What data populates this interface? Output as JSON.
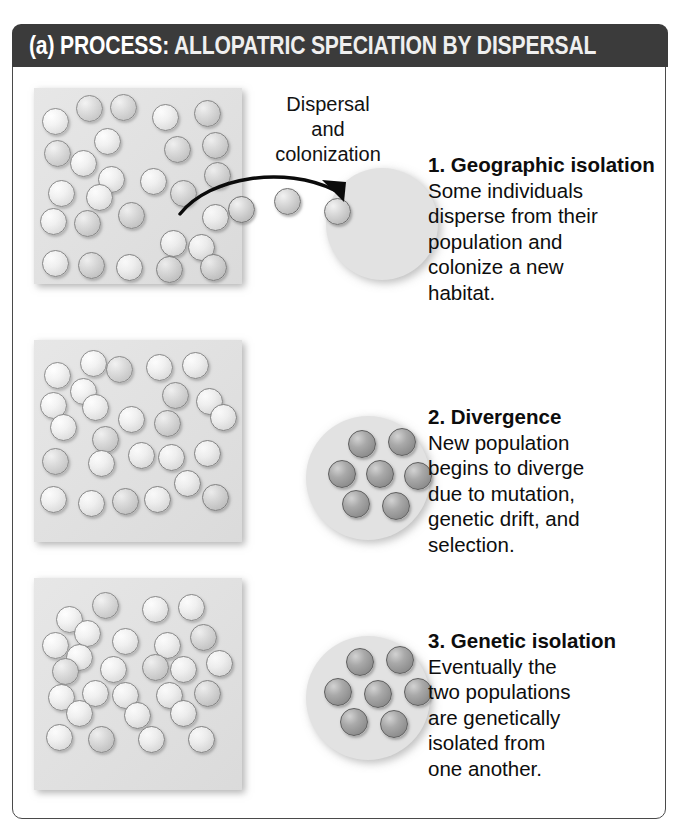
{
  "figure": {
    "panel_label": "(a)",
    "header_keyword": "PROCESS:",
    "header_title": "ALLOPATRIC SPECIATION BY DISPERSAL",
    "header_bg_color": "#3b3b3b",
    "header_text_color": "#ffffff",
    "frame_border_color": "#4a4a4a",
    "habitat_fill_color": "#e0e0e0"
  },
  "arrow_label": {
    "line1": "Dispersal",
    "line2": "and",
    "line3": "colonization",
    "full_text": "Dispersal and colonization"
  },
  "steps": [
    {
      "number": "1.",
      "title": "1. Geographic\nisolation",
      "body": "Some individuals\ndisperse from their\npopulation and\ncolonize a new\nhabitat."
    },
    {
      "number": "2.",
      "title": "2. Divergence",
      "body": "New population\nbegins to diverge\ndue to mutation,\ngenetic drift, and\nselection."
    },
    {
      "number": "3.",
      "title": "3. Genetic isolation",
      "body": "Eventually the\ntwo populations\nare genetically\nisolated from\none another."
    }
  ],
  "populations": {
    "mainland_row1": {
      "name": "mainland-population-stage-1",
      "dot_count": 30,
      "dot_shades": "light and medium gray"
    },
    "mainland_row2": {
      "name": "mainland-population-stage-2",
      "dot_count": 29,
      "dot_shades": "light and medium gray"
    },
    "mainland_row3": {
      "name": "mainland-population-stage-3",
      "dot_count": 30,
      "dot_shades": "light and medium gray"
    },
    "island_row1": {
      "name": "new-habitat-empty",
      "dot_count": 0,
      "dot_shades": "none"
    },
    "island_row2": {
      "name": "new-habitat-diverging",
      "dot_count": 7,
      "dot_shades": "medium gray"
    },
    "island_row3": {
      "name": "new-habitat-isolated",
      "dot_count": 7,
      "dot_shades": "dark gray"
    },
    "dispersing": {
      "name": "dispersing-individuals",
      "dot_count": 3,
      "dot_shades": "medium gray"
    }
  },
  "chart_data": {
    "type": "diagram",
    "title": "(a) PROCESS: ALLOPATRIC SPECIATION BY DISPERSAL",
    "rows": [
      {
        "stage": "1. Geographic isolation",
        "mainland_dots": 30,
        "island_dots": 0,
        "island_shade": "empty",
        "annotation": "Dispersal and colonization"
      },
      {
        "stage": "2. Divergence",
        "mainland_dots": 29,
        "island_dots": 7,
        "island_shade": "medium gray",
        "annotation": ""
      },
      {
        "stage": "3. Genetic isolation",
        "mainland_dots": 30,
        "island_dots": 7,
        "island_shade": "dark gray",
        "annotation": ""
      }
    ]
  },
  "dot_layout": {
    "mainland1": [
      [
        8,
        20,
        "light"
      ],
      [
        42,
        7,
        "mid"
      ],
      [
        76,
        6,
        "mid"
      ],
      [
        118,
        16,
        "light"
      ],
      [
        160,
        12,
        "mid"
      ],
      [
        60,
        40,
        "light"
      ],
      [
        130,
        48,
        "mid"
      ],
      [
        168,
        44,
        "mid"
      ],
      [
        10,
        52,
        "mid"
      ],
      [
        36,
        62,
        "light"
      ],
      [
        64,
        78,
        "light"
      ],
      [
        106,
        80,
        "light"
      ],
      [
        170,
        74,
        "mid"
      ],
      [
        14,
        92,
        "light"
      ],
      [
        52,
        96,
        "light"
      ],
      [
        136,
        92,
        "mid"
      ],
      [
        6,
        120,
        "light"
      ],
      [
        40,
        122,
        "mid"
      ],
      [
        84,
        114,
        "mid"
      ],
      [
        168,
        116,
        "light"
      ],
      [
        126,
        142,
        "light"
      ],
      [
        154,
        146,
        "light"
      ],
      [
        8,
        162,
        "light"
      ],
      [
        44,
        164,
        "mid"
      ],
      [
        82,
        166,
        "light"
      ],
      [
        122,
        168,
        "mid"
      ],
      [
        166,
        166,
        "mid"
      ]
    ],
    "mainland2": [
      [
        10,
        22,
        "light"
      ],
      [
        46,
        10,
        "light"
      ],
      [
        72,
        16,
        "mid"
      ],
      [
        112,
        14,
        "light"
      ],
      [
        148,
        12,
        "light"
      ],
      [
        36,
        38,
        "light"
      ],
      [
        128,
        42,
        "mid"
      ],
      [
        162,
        48,
        "light"
      ],
      [
        6,
        52,
        "light"
      ],
      [
        48,
        54,
        "light"
      ],
      [
        84,
        66,
        "light"
      ],
      [
        120,
        70,
        "mid"
      ],
      [
        176,
        64,
        "light"
      ],
      [
        16,
        74,
        "light"
      ],
      [
        58,
        86,
        "mid"
      ],
      [
        8,
        108,
        "mid"
      ],
      [
        54,
        110,
        "light"
      ],
      [
        94,
        102,
        "light"
      ],
      [
        124,
        104,
        "light"
      ],
      [
        160,
        100,
        "light"
      ],
      [
        140,
        130,
        "light"
      ],
      [
        6,
        146,
        "light"
      ],
      [
        44,
        150,
        "light"
      ],
      [
        78,
        148,
        "mid"
      ],
      [
        110,
        146,
        "light"
      ],
      [
        168,
        144,
        "mid"
      ]
    ],
    "mainland3": [
      [
        22,
        28,
        "light"
      ],
      [
        58,
        14,
        "mid"
      ],
      [
        108,
        18,
        "light"
      ],
      [
        144,
        16,
        "light"
      ],
      [
        40,
        42,
        "light"
      ],
      [
        78,
        50,
        "light"
      ],
      [
        120,
        54,
        "light"
      ],
      [
        156,
        46,
        "mid"
      ],
      [
        8,
        54,
        "light"
      ],
      [
        32,
        66,
        "light"
      ],
      [
        66,
        78,
        "light"
      ],
      [
        108,
        76,
        "mid"
      ],
      [
        136,
        78,
        "light"
      ],
      [
        172,
        72,
        "light"
      ],
      [
        18,
        80,
        "mid"
      ],
      [
        14,
        106,
        "light"
      ],
      [
        48,
        102,
        "light"
      ],
      [
        78,
        104,
        "light"
      ],
      [
        122,
        104,
        "light"
      ],
      [
        160,
        102,
        "mid"
      ],
      [
        32,
        122,
        "light"
      ],
      [
        90,
        124,
        "light"
      ],
      [
        136,
        122,
        "light"
      ],
      [
        12,
        146,
        "light"
      ],
      [
        54,
        148,
        "mid"
      ],
      [
        104,
        148,
        "light"
      ],
      [
        154,
        148,
        "light"
      ]
    ],
    "island2": [
      [
        42,
        14,
        "dark"
      ],
      [
        82,
        12,
        "dark"
      ],
      [
        22,
        44,
        "dark"
      ],
      [
        60,
        44,
        "dark"
      ],
      [
        98,
        46,
        "dark"
      ],
      [
        36,
        74,
        "dark"
      ],
      [
        76,
        76,
        "dark"
      ]
    ],
    "island3": [
      [
        40,
        12,
        "dark"
      ],
      [
        80,
        10,
        "dark"
      ],
      [
        18,
        42,
        "dark"
      ],
      [
        58,
        44,
        "dark"
      ],
      [
        98,
        42,
        "dark"
      ],
      [
        34,
        72,
        "dark"
      ],
      [
        74,
        74,
        "dark"
      ]
    ],
    "dispersing": [
      [
        0,
        0,
        "mid"
      ],
      [
        46,
        -8,
        "mid"
      ],
      [
        96,
        2,
        "mid"
      ]
    ]
  }
}
